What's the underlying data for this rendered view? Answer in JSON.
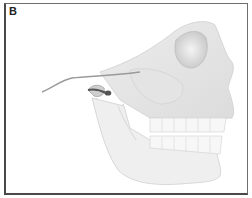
{
  "figure": {
    "panel_label": "B",
    "colors": {
      "border": "#4a4a4a",
      "bone_light": "#f2f2f2",
      "bone_mid": "#d9d9d9",
      "bone_shadow": "#b8b8b8",
      "joint_dark": "#555555"
    }
  }
}
